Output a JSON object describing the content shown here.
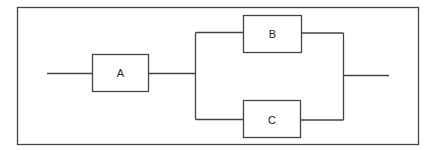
{
  "diagram": {
    "type": "reliability-block-diagram",
    "colors": {
      "stroke": "#444444",
      "text": "#222222",
      "background": "#ffffff"
    },
    "blocks": [
      {
        "id": "A",
        "label": "A",
        "x": 92,
        "y": 54,
        "w": 56,
        "h": 37
      },
      {
        "id": "B",
        "label": "B",
        "x": 243,
        "y": 15,
        "w": 58,
        "h": 37
      },
      {
        "id": "C",
        "label": "C",
        "x": 243,
        "y": 100,
        "w": 57,
        "h": 37
      }
    ],
    "connections": [
      {
        "from": "input",
        "to": "A"
      },
      {
        "from": "A",
        "to": "B"
      },
      {
        "from": "A",
        "to": "C"
      },
      {
        "from": "B",
        "to": "output"
      },
      {
        "from": "C",
        "to": "output"
      }
    ]
  }
}
